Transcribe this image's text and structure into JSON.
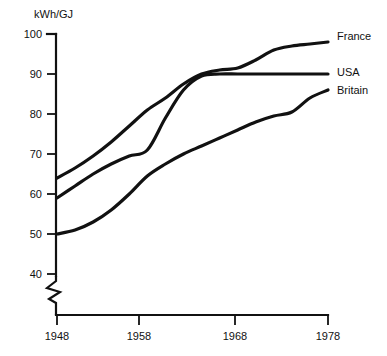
{
  "chart_data": {
    "type": "line",
    "title": "",
    "xlabel": "",
    "ylabel": "kWh/GJ",
    "ylim": [
      40,
      100
    ],
    "xlim": [
      1948,
      1978
    ],
    "grid": false,
    "axis_break": "y-axis broken below 40",
    "legend_position": "right-of-line-ends",
    "ytick_labels": [
      "100",
      "90",
      "80",
      "70",
      "60",
      "50",
      "40"
    ],
    "ytick_values": [
      100,
      90,
      80,
      70,
      60,
      50,
      40
    ],
    "xtick_labels": [
      "1948",
      "1958",
      "1968",
      "1978"
    ],
    "xtick_values": [
      1948,
      1958,
      1968,
      1978
    ],
    "series": [
      {
        "name": "France",
        "label": "France",
        "color": "#111111",
        "x": [
          1948,
          1950,
          1952,
          1954,
          1956,
          1958,
          1960,
          1962,
          1964,
          1966,
          1968,
          1970,
          1972,
          1974,
          1976,
          1978
        ],
        "values": [
          64,
          66.5,
          69.5,
          73,
          77,
          81,
          84,
          87.5,
          90,
          91,
          91.5,
          93.5,
          96,
          97,
          97.5,
          98
        ]
      },
      {
        "name": "USA",
        "label": "USA",
        "color": "#111111",
        "x": [
          1948,
          1950,
          1952,
          1954,
          1956,
          1958,
          1960,
          1962,
          1964,
          1966,
          1968,
          1970,
          1972,
          1974,
          1976,
          1978
        ],
        "values": [
          59,
          62,
          65,
          67.5,
          69.5,
          71,
          79,
          86,
          89.5,
          90,
          90,
          90,
          90,
          90,
          90,
          90
        ]
      },
      {
        "name": "Britain",
        "label": "Britain",
        "color": "#111111",
        "x": [
          1948,
          1950,
          1952,
          1954,
          1956,
          1958,
          1960,
          1962,
          1964,
          1966,
          1968,
          1970,
          1972,
          1974,
          1976,
          1978
        ],
        "values": [
          50,
          51,
          53,
          56,
          60,
          64.5,
          67.5,
          70,
          72,
          74,
          76,
          78,
          79.5,
          80.5,
          84,
          86
        ]
      }
    ]
  },
  "axis": {
    "y_title": "kWh/GJ"
  }
}
